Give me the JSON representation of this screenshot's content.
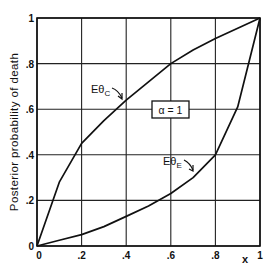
{
  "chart_data": {
    "type": "line",
    "title": "",
    "xlabel": "x",
    "ylabel": "Posterior probability of death",
    "xlim": [
      0,
      1
    ],
    "ylim": [
      0,
      1
    ],
    "grid": true,
    "xticks": [
      "0",
      ".2",
      ".4",
      ".6",
      ".8",
      "1"
    ],
    "yticks": [
      "0",
      ".2",
      ".4",
      ".6",
      ".8",
      "1"
    ],
    "annotation_box": "α = 1",
    "series": [
      {
        "name": "Eθ_C",
        "label_main": "Eθ",
        "label_sub": "C",
        "x": [
          0,
          0.1,
          0.2,
          0.3,
          0.4,
          0.5,
          0.6,
          0.7,
          0.8,
          0.9,
          1.0
        ],
        "y": [
          0,
          0.28,
          0.45,
          0.55,
          0.64,
          0.72,
          0.8,
          0.86,
          0.91,
          0.955,
          1.0
        ]
      },
      {
        "name": "Eθ_E",
        "label_main": "Eθ",
        "label_sub": "E",
        "x": [
          0,
          0.1,
          0.2,
          0.3,
          0.4,
          0.5,
          0.6,
          0.7,
          0.8,
          0.9,
          1.0
        ],
        "y": [
          0,
          0.025,
          0.05,
          0.085,
          0.13,
          0.175,
          0.23,
          0.3,
          0.4,
          0.61,
          1.0
        ]
      }
    ]
  }
}
